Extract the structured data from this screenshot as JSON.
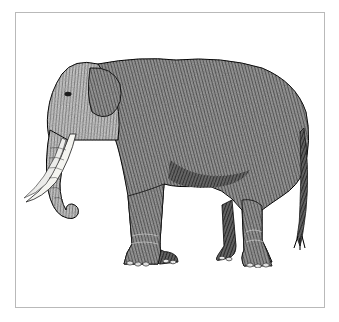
{
  "figure": {
    "style": "engraving",
    "caption": "",
    "colors": {
      "ink": "#1a1a1a",
      "midtone": "#555555",
      "highlight": "#e9e9e9",
      "tusk": "#f4f4f0",
      "frame": "#b9b9b9",
      "background": "#ffffff"
    }
  }
}
